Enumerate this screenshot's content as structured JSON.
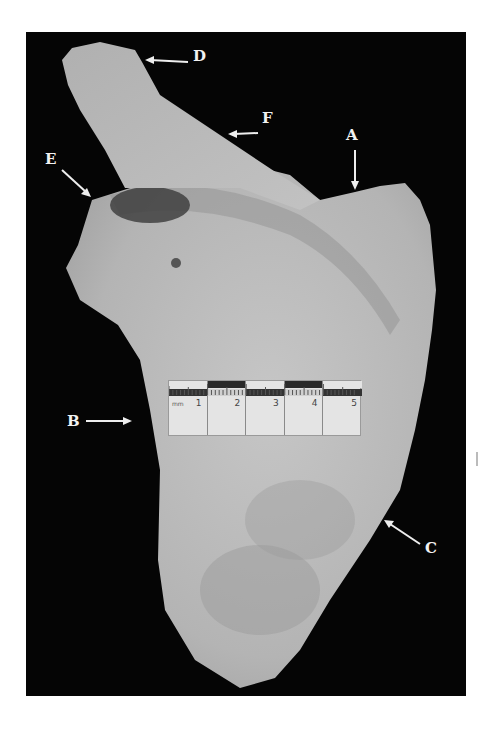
{
  "figure": {
    "background_color": "#050505",
    "bone_color": "#b9b9b9",
    "labels": [
      {
        "id": "A",
        "text": "A",
        "x": 345,
        "y": 135,
        "arrow": "down"
      },
      {
        "id": "B",
        "text": "B",
        "x": 68,
        "y": 417,
        "arrow": "right"
      },
      {
        "id": "C",
        "text": "C",
        "x": 426,
        "y": 548,
        "arrow": "up-left"
      },
      {
        "id": "D",
        "text": "D",
        "x": 193,
        "y": 56,
        "arrow": "left"
      },
      {
        "id": "E",
        "text": "E",
        "x": 46,
        "y": 158,
        "arrow": "down-right"
      },
      {
        "id": "F",
        "text": "F",
        "x": 261,
        "y": 118,
        "arrow": "left"
      }
    ]
  },
  "scale_bar": {
    "unit": "mm",
    "numbers": [
      "1",
      "2",
      "3",
      "4",
      "5"
    ]
  }
}
